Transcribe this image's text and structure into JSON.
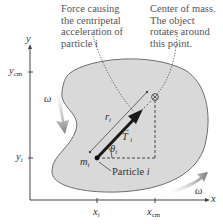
{
  "figure": {
    "type": "rigid-body rotation about center of mass",
    "callouts": {
      "force": [
        "Force causing",
        "the centripetal",
        "acceleration of",
        "particle i"
      ],
      "center_of_mass": [
        "Center of mass.",
        "The object",
        "rotates around",
        "this point."
      ]
    },
    "axes": {
      "x_label": "x",
      "y_label": "y",
      "x_ticks": [
        {
          "label": "x",
          "sub": "i"
        },
        {
          "label": "x",
          "sub": "cm"
        }
      ],
      "y_ticks": [
        {
          "label": "y",
          "sub": "cm"
        },
        {
          "label": "y",
          "sub": "i"
        }
      ]
    },
    "symbols": {
      "omega": "ω",
      "radius": "r",
      "radius_sub": "i",
      "force": "T",
      "force_sub": "i",
      "angle": "θ",
      "angle_sub": "i",
      "mass": "m",
      "mass_sub": "i"
    },
    "particle_label": "Particle",
    "particle_label_var": "i",
    "colors": {
      "body_fill": "#d9d9d9",
      "body_stroke": "#6e6e6e",
      "axis": "#444444",
      "arrow_dark": "#1a1a1a",
      "rotation_arrow": "#8a8a8a",
      "text": "#333333"
    }
  }
}
